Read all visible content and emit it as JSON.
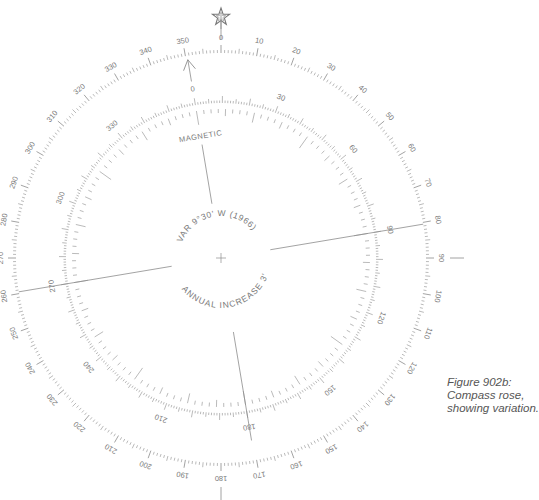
{
  "figure": {
    "caption_lines": [
      "Figure 902b:",
      "Compass rose,",
      "showing variation."
    ]
  },
  "compass": {
    "center": [
      221,
      258
    ],
    "ink_color": "#8c8c8c",
    "text_color": "#7a7a7a",
    "north_symbol": "star",
    "true_ring": {
      "radius": 205,
      "label_step": 10,
      "labels": [
        "0",
        "10",
        "20",
        "30",
        "40",
        "50",
        "60",
        "70",
        "80",
        "90",
        "100",
        "110",
        "120",
        "130",
        "140",
        "150",
        "160",
        "170",
        "180",
        "190",
        "200",
        "210",
        "220",
        "230",
        "240",
        "250",
        "260",
        "270",
        "280",
        "290",
        "300",
        "310",
        "320",
        "330",
        "340",
        "350"
      ],
      "cardinal_ticks": [
        0,
        90,
        180,
        270
      ]
    },
    "magnetic_ring": {
      "radius": 155,
      "rotation_deg": -9.5,
      "label_step": 30,
      "labels": [
        "0",
        "30",
        "60",
        "90",
        "120",
        "150",
        "180",
        "210",
        "240",
        "270",
        "300",
        "330"
      ],
      "title": "MAGNETIC",
      "arrow_heading_true": 350.5
    },
    "center_text": {
      "variation": "VAR 9°30' W (1966)",
      "annual_change": "ANNUAL INCREASE 3'"
    }
  }
}
